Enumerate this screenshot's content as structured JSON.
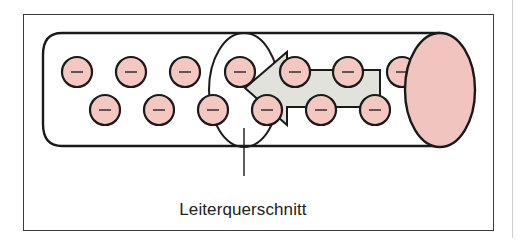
{
  "diagram": {
    "label": "Leiterquerschnitt",
    "colors": {
      "electron_fill": "#f4c7c0",
      "end_face_fill": "#f2c4c0",
      "arrow_fill": "#e2e2dd",
      "stroke": "#1a1a1a",
      "frame": "#3a3a3a"
    },
    "electron_symbol": "−",
    "electrons_row1": [
      77,
      131,
      185,
      240,
      295,
      348,
      402
    ],
    "electrons_row2": [
      105,
      159,
      213,
      267,
      321,
      375
    ],
    "row1_y": 72,
    "row2_y": 110,
    "electron_radius": 15
  }
}
